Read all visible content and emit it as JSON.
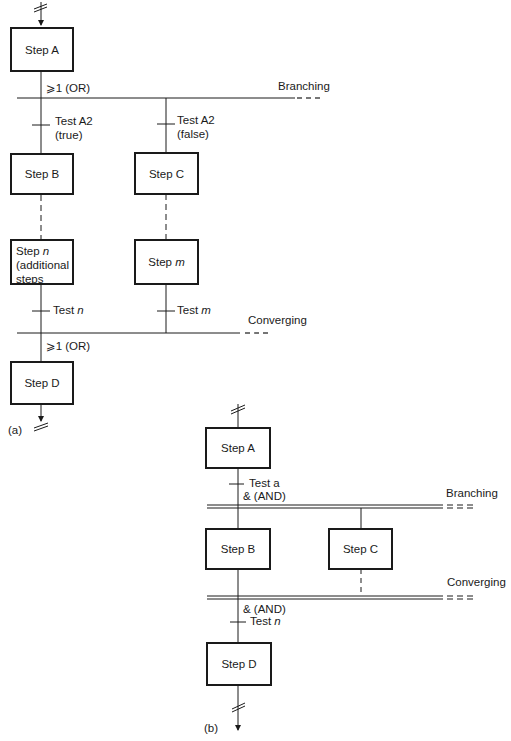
{
  "panel_a": {
    "caption": "(a)",
    "steps": {
      "a": "Step A",
      "b": "Step B",
      "c": "Step C",
      "n_prefix": "Step ",
      "n_var": "n",
      "n_line2": "(additional",
      "n_line3": "steps",
      "m_prefix": "Step ",
      "m_var": "m",
      "d": "Step D"
    },
    "labels": {
      "or_top": "⩾1 (OR)",
      "branching": "Branching",
      "test_a2_true_1": "Test A2",
      "test_a2_true_2": "(true)",
      "test_a2_false_1": "Test A2",
      "test_a2_false_2": "(false)",
      "test_n_prefix": "Test ",
      "test_n_var": "n",
      "test_m_prefix": "Test ",
      "test_m_var": "m",
      "converging": "Converging",
      "or_bottom": "⩾1 (OR)"
    }
  },
  "panel_b": {
    "caption": "(b)",
    "steps": {
      "a": "Step A",
      "b": "Step B",
      "c": "Step C",
      "d": "Step D"
    },
    "labels": {
      "test_a": "Test a",
      "and_top": "& (AND)",
      "branching": "Branching",
      "converging": "Converging",
      "and_bottom": "& (AND)",
      "test_n_prefix": "Test ",
      "test_n_var": "n"
    }
  },
  "colors": {
    "line": "#1a1a1a",
    "background": "#ffffff"
  }
}
